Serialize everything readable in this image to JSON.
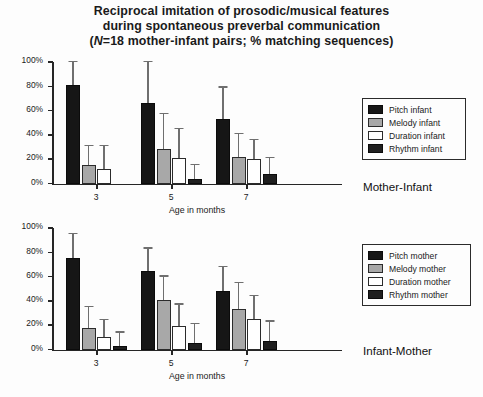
{
  "title": {
    "line1": "Reciprocal imitation of prosodic/musical features",
    "line2": "during spontaneous preverbal communication",
    "line3_pre": "(",
    "line3_italic": "N",
    "line3_post": "=18 mother-infant pairs; % matching sequences)"
  },
  "axis": {
    "xlabel": "Age in months",
    "yticks": [
      "0%",
      "20%",
      "40%",
      "60%",
      "80%",
      "100%"
    ],
    "xcats": [
      "3",
      "5",
      "7"
    ]
  },
  "panels": {
    "top": {
      "caption": "Mother-Infant",
      "legend": [
        {
          "label": "Pitch infant",
          "key": "pitch"
        },
        {
          "label": "Melody infant",
          "key": "melody"
        },
        {
          "label": "Duration infant",
          "key": "duration"
        },
        {
          "label": "Rhythm infant",
          "key": "rhythm"
        }
      ]
    },
    "bottom": {
      "caption": "Infant-Mother",
      "legend": [
        {
          "label": "Pitch mother",
          "key": "pitch"
        },
        {
          "label": "Melody mother",
          "key": "melody"
        },
        {
          "label": "Duration mother",
          "key": "duration"
        },
        {
          "label": "Rhythm mother",
          "key": "rhythm"
        }
      ]
    }
  },
  "colors": {
    "pitch": "#161616",
    "melody": "#a8a8a8",
    "duration": "#ffffff",
    "rhythm": "#1f1f1f",
    "axis": "#262626",
    "error_bar": "#6f6f6f",
    "background": "#fdfdfd"
  },
  "chart_data": [
    {
      "type": "bar",
      "title": "Mother-Infant",
      "xlabel": "Age in months",
      "ylabel": "",
      "ylim": [
        0,
        100
      ],
      "yticks": [
        0,
        20,
        40,
        60,
        80,
        100
      ],
      "grid": false,
      "legend_position": "right",
      "categories": [
        "3",
        "5",
        "7"
      ],
      "series": [
        {
          "name": "Pitch infant",
          "values": [
            81,
            66,
            53
          ],
          "errors_upper": [
            100,
            100,
            79
          ]
        },
        {
          "name": "Melody infant",
          "values": [
            15,
            28,
            22
          ],
          "errors_upper": [
            31,
            57,
            41
          ]
        },
        {
          "name": "Duration infant",
          "values": [
            12,
            21,
            20
          ],
          "errors_upper": [
            31,
            45,
            36
          ]
        },
        {
          "name": "Rhythm infant",
          "values": [
            0,
            4,
            8
          ],
          "errors_upper": [
            0,
            15,
            21
          ]
        }
      ]
    },
    {
      "type": "bar",
      "title": "Infant-Mother",
      "xlabel": "Age in months",
      "ylabel": "",
      "ylim": [
        0,
        100
      ],
      "yticks": [
        0,
        20,
        40,
        60,
        80,
        100
      ],
      "grid": false,
      "legend_position": "right",
      "categories": [
        "3",
        "5",
        "7"
      ],
      "series": [
        {
          "name": "Pitch mother",
          "values": [
            75,
            65,
            48
          ],
          "errors_upper": [
            95,
            83,
            68
          ]
        },
        {
          "name": "Melody mother",
          "values": [
            18,
            41,
            33
          ],
          "errors_upper": [
            35,
            60,
            55
          ]
        },
        {
          "name": "Duration mother",
          "values": [
            10,
            19,
            25
          ],
          "errors_upper": [
            24,
            37,
            44
          ]
        },
        {
          "name": "Rhythm mother",
          "values": [
            3,
            5,
            7
          ],
          "errors_upper": [
            14,
            21,
            23
          ]
        }
      ]
    }
  ]
}
